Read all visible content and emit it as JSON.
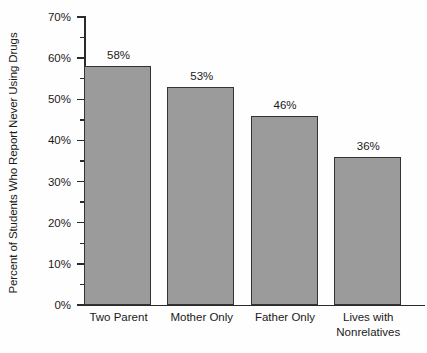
{
  "chart_data": {
    "type": "bar",
    "title": "",
    "xlabel": "",
    "ylabel": "Percent of Students Who Report Never Using Drugs",
    "categories": [
      "Two Parent",
      "Mother Only",
      "Father Only",
      "Lives with Nonrelatives"
    ],
    "category_lines": [
      [
        "Two Parent"
      ],
      [
        "Mother Only"
      ],
      [
        "Father Only"
      ],
      [
        "Lives with",
        "Nonrelatives"
      ]
    ],
    "values": [
      58,
      53,
      46,
      36
    ],
    "value_labels": [
      "58%",
      "53%",
      "46%",
      "36%"
    ],
    "ylim": [
      0,
      70
    ],
    "ytick_values": [
      0,
      10,
      20,
      30,
      40,
      50,
      60,
      70
    ],
    "ytick_labels": [
      "0%",
      "10%",
      "20%",
      "30%",
      "40%",
      "50%",
      "60%",
      "70%"
    ],
    "yminor_tick_values": [
      5,
      15,
      25,
      35,
      45,
      55,
      65
    ],
    "grid": false,
    "legend": "none",
    "bar_color": "#9b9b9b",
    "bar_edge_color": "#333333",
    "axis_color": "#2b2b2b",
    "background_color": "#fefefe"
  }
}
